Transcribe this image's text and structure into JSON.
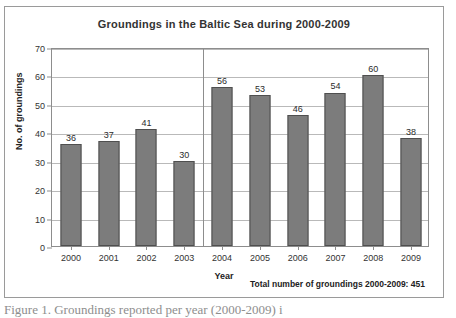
{
  "chart_data": {
    "type": "bar",
    "title": "Groundings in the Baltic Sea during 2000-2009",
    "xlabel": "Year",
    "ylabel": "No. of groundings",
    "categories": [
      "2000",
      "2001",
      "2002",
      "2003",
      "2004",
      "2005",
      "2006",
      "2007",
      "2008",
      "2009"
    ],
    "values": [
      36,
      37,
      41,
      30,
      56,
      53,
      46,
      54,
      60,
      38
    ],
    "ylim": [
      0,
      70
    ],
    "yticks": [
      0,
      10,
      20,
      30,
      40,
      50,
      60,
      70
    ],
    "ytick_labels": [
      "0",
      "10",
      "20",
      "30",
      "40",
      "50",
      "60",
      "70"
    ],
    "grid": "horizontal",
    "legend": "none",
    "annotations": {
      "divider_after_category": "2003",
      "total_note": "Total number of groundings 2000-2009: 451"
    },
    "colors": {
      "bar_fill": "#7c7c7c",
      "bar_border": "#4f4f4f",
      "gridline": "#b9b9b9",
      "axis": "#8d8d8d",
      "frame": "#9a9a9a",
      "text": "#2b2b2b"
    }
  },
  "caption": {
    "text": "Figure 1. Groundings reported per year (2000-2009) i"
  }
}
